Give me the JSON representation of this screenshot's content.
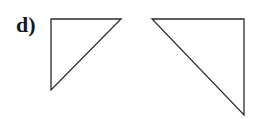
{
  "problem": {
    "label": "d)"
  },
  "shapes": [
    {
      "name": "left-right-triangle",
      "type": "right-triangle",
      "right_angle_corner": "top-left",
      "points": "51,19 121,19 51,90"
    },
    {
      "name": "right-right-triangle",
      "type": "right-triangle",
      "right_angle_corner": "top-right",
      "points": "152,19 244,19 244,115"
    }
  ],
  "colors": {
    "stroke": "#2a2a2a",
    "fill": "#ffffff",
    "background": "#ffffff"
  }
}
